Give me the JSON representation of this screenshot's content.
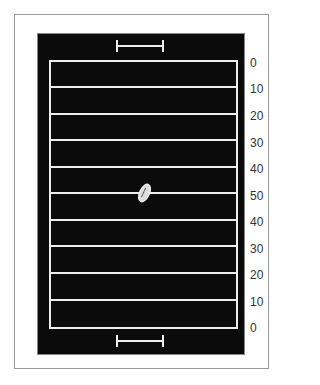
{
  "field": {
    "background_color": "#0b0b0b",
    "line_color": "#eeeeee",
    "yard_labels": [
      "0",
      "10",
      "20",
      "30",
      "40",
      "50",
      "40",
      "30",
      "20",
      "10",
      "0"
    ],
    "yard_line_y": [
      61,
      87,
      114,
      140,
      167,
      193,
      220,
      246,
      273,
      300,
      327
    ],
    "label_y": [
      57,
      83,
      110,
      137,
      163,
      190,
      216,
      243,
      269,
      296,
      322
    ]
  },
  "icons": {
    "top_goal": "goalpost-icon",
    "bottom_goal": "goalpost-icon",
    "ball": "football-icon"
  }
}
